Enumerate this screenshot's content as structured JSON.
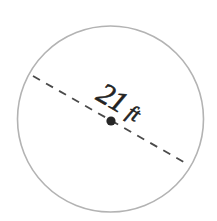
{
  "figure": {
    "background_color": "#ffffff"
  },
  "shape": {
    "name": "circle",
    "stroke_color": "#b3b3b3",
    "stroke_width": 1.6,
    "fill": "none",
    "center_x": 110.5,
    "center_y": 119,
    "radius": 93
  },
  "center_point": {
    "label": "center-dot",
    "color": "#262626",
    "radius": 4.6,
    "x": 111,
    "y": 121
  },
  "diameter": {
    "label_value": "21",
    "label_unit": "ft",
    "label_full": "21 ft",
    "line_color": "#4a4a4a",
    "line_width": 1.8,
    "dash_length": 8,
    "dash_gap": 7,
    "angle_degrees": 29.7,
    "start_x": 33,
    "start_y": 76,
    "end_x": 189,
    "end_y": 165
  }
}
